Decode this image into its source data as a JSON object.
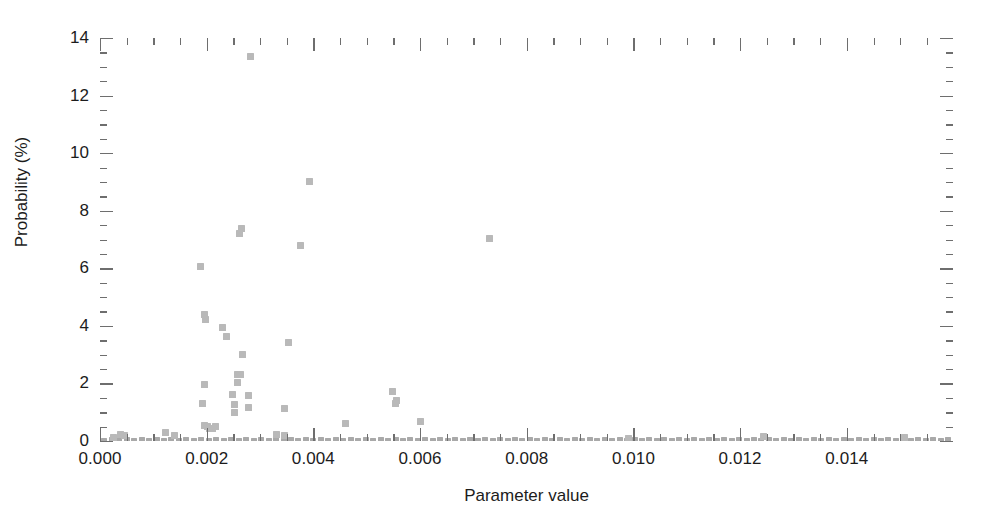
{
  "chart_data": {
    "type": "scatter",
    "title": "",
    "xlabel": "Parameter value",
    "ylabel": "Probability (%)",
    "xlim": [
      0.0,
      0.01599
    ],
    "ylim": [
      0,
      14
    ],
    "grid": false,
    "legend": null,
    "marker": {
      "shape": "square",
      "color": "#b9b9b9",
      "size_px": 7
    },
    "axis_color": "#6e6e6e",
    "x_ticks_major": [
      0.0,
      0.002,
      0.004,
      0.006,
      0.008,
      0.01,
      0.012,
      0.014
    ],
    "x_tick_labels": [
      "0.000",
      "0.002",
      "0.004",
      "0.006",
      "0.008",
      "0.010",
      "0.012",
      "0.014"
    ],
    "x_minor_interval": 0.0005,
    "y_ticks_major": [
      0,
      2,
      4,
      6,
      8,
      10,
      12,
      14
    ],
    "y_tick_labels": [
      "0",
      "2",
      "4",
      "6",
      "8",
      "10",
      "12",
      "14"
    ],
    "y_minor_interval": 0.5,
    "points": [
      [
        0.00283,
        13.35
      ],
      [
        0.00392,
        9.0
      ],
      [
        0.00731,
        7.05
      ],
      [
        0.00265,
        7.38
      ],
      [
        0.00262,
        7.22
      ],
      [
        0.00376,
        6.78
      ],
      [
        0.00188,
        6.05
      ],
      [
        0.00196,
        4.38
      ],
      [
        0.00197,
        4.22
      ],
      [
        0.00229,
        3.95
      ],
      [
        0.00237,
        3.62
      ],
      [
        0.00268,
        3.02
      ],
      [
        0.00353,
        3.42
      ],
      [
        0.00257,
        2.32
      ],
      [
        0.00263,
        2.3
      ],
      [
        0.00258,
        2.02
      ],
      [
        0.00196,
        1.95
      ],
      [
        0.00248,
        1.62
      ],
      [
        0.00279,
        1.58
      ],
      [
        0.00252,
        1.28
      ],
      [
        0.00193,
        1.3
      ],
      [
        0.00278,
        1.18
      ],
      [
        0.00252,
        0.98
      ],
      [
        0.00548,
        1.72
      ],
      [
        0.00556,
        1.42
      ],
      [
        0.00553,
        1.32
      ],
      [
        0.00345,
        1.12
      ],
      [
        0.00196,
        0.55
      ],
      [
        0.00202,
        0.5
      ],
      [
        0.00205,
        0.45
      ],
      [
        0.00211,
        0.42
      ],
      [
        0.00216,
        0.52
      ],
      [
        0.00461,
        0.62
      ],
      [
        0.00601,
        0.68
      ],
      [
        0.0033,
        0.22
      ],
      [
        0.00345,
        0.2
      ],
      [
        0.00123,
        0.28
      ],
      [
        0.00139,
        0.18
      ],
      [
        0.00038,
        0.22
      ],
      [
        0.00045,
        0.18
      ],
      [
        0.00026,
        0.12
      ],
      [
        0.00991,
        0.1
      ],
      [
        0.01243,
        0.14
      ],
      [
        0.01508,
        0.12
      ]
    ],
    "baseline_points": [
      [
        8e-05,
        0.03
      ],
      [
        0.00022,
        0.04
      ],
      [
        0.00036,
        0.03
      ],
      [
        0.0005,
        0.05
      ],
      [
        0.00064,
        0.03
      ],
      [
        0.00078,
        0.04
      ],
      [
        0.00092,
        0.03
      ],
      [
        0.00106,
        0.05
      ],
      [
        0.0012,
        0.03
      ],
      [
        0.00134,
        0.04
      ],
      [
        0.00148,
        0.03
      ],
      [
        0.00162,
        0.05
      ],
      [
        0.00176,
        0.03
      ],
      [
        0.0019,
        0.04
      ],
      [
        0.00204,
        0.03
      ],
      [
        0.00218,
        0.05
      ],
      [
        0.00232,
        0.03
      ],
      [
        0.00246,
        0.04
      ],
      [
        0.0026,
        0.03
      ],
      [
        0.00274,
        0.05
      ],
      [
        0.00288,
        0.03
      ],
      [
        0.00302,
        0.04
      ],
      [
        0.00316,
        0.03
      ],
      [
        0.0033,
        0.05
      ],
      [
        0.00344,
        0.03
      ],
      [
        0.00358,
        0.04
      ],
      [
        0.00372,
        0.03
      ],
      [
        0.00386,
        0.05
      ],
      [
        0.004,
        0.03
      ],
      [
        0.00414,
        0.04
      ],
      [
        0.00428,
        0.03
      ],
      [
        0.00442,
        0.05
      ],
      [
        0.00456,
        0.03
      ],
      [
        0.0047,
        0.04
      ],
      [
        0.00484,
        0.03
      ],
      [
        0.00498,
        0.05
      ],
      [
        0.00512,
        0.03
      ],
      [
        0.00526,
        0.04
      ],
      [
        0.0054,
        0.03
      ],
      [
        0.00554,
        0.05
      ],
      [
        0.00568,
        0.03
      ],
      [
        0.00582,
        0.04
      ],
      [
        0.00596,
        0.03
      ],
      [
        0.0061,
        0.05
      ],
      [
        0.00624,
        0.03
      ],
      [
        0.00638,
        0.04
      ],
      [
        0.00652,
        0.03
      ],
      [
        0.00666,
        0.05
      ],
      [
        0.0068,
        0.03
      ],
      [
        0.00694,
        0.04
      ],
      [
        0.00708,
        0.03
      ],
      [
        0.00722,
        0.05
      ],
      [
        0.00736,
        0.03
      ],
      [
        0.0075,
        0.04
      ],
      [
        0.00764,
        0.03
      ],
      [
        0.00778,
        0.05
      ],
      [
        0.00792,
        0.03
      ],
      [
        0.00806,
        0.04
      ],
      [
        0.0082,
        0.03
      ],
      [
        0.00834,
        0.05
      ],
      [
        0.00848,
        0.03
      ],
      [
        0.00862,
        0.04
      ],
      [
        0.00876,
        0.03
      ],
      [
        0.0089,
        0.05
      ],
      [
        0.00904,
        0.03
      ],
      [
        0.00918,
        0.04
      ],
      [
        0.00932,
        0.03
      ],
      [
        0.00946,
        0.05
      ],
      [
        0.0096,
        0.03
      ],
      [
        0.00974,
        0.04
      ],
      [
        0.00988,
        0.03
      ],
      [
        0.01002,
        0.05
      ],
      [
        0.01016,
        0.03
      ],
      [
        0.0103,
        0.04
      ],
      [
        0.01044,
        0.03
      ],
      [
        0.01058,
        0.05
      ],
      [
        0.01072,
        0.03
      ],
      [
        0.01086,
        0.04
      ],
      [
        0.011,
        0.03
      ],
      [
        0.01114,
        0.05
      ],
      [
        0.01128,
        0.03
      ],
      [
        0.01142,
        0.04
      ],
      [
        0.01156,
        0.03
      ],
      [
        0.0117,
        0.05
      ],
      [
        0.01184,
        0.03
      ],
      [
        0.01198,
        0.04
      ],
      [
        0.01212,
        0.03
      ],
      [
        0.01226,
        0.05
      ],
      [
        0.0124,
        0.03
      ],
      [
        0.01254,
        0.04
      ],
      [
        0.01268,
        0.03
      ],
      [
        0.01282,
        0.05
      ],
      [
        0.01296,
        0.03
      ],
      [
        0.0131,
        0.04
      ],
      [
        0.01324,
        0.03
      ],
      [
        0.01338,
        0.05
      ],
      [
        0.01352,
        0.03
      ],
      [
        0.01366,
        0.04
      ],
      [
        0.0138,
        0.03
      ],
      [
        0.01394,
        0.05
      ],
      [
        0.01408,
        0.03
      ],
      [
        0.01422,
        0.04
      ],
      [
        0.01436,
        0.03
      ],
      [
        0.0145,
        0.05
      ],
      [
        0.01464,
        0.03
      ],
      [
        0.01478,
        0.04
      ],
      [
        0.01492,
        0.03
      ],
      [
        0.01506,
        0.05
      ],
      [
        0.0152,
        0.03
      ],
      [
        0.01534,
        0.04
      ],
      [
        0.01548,
        0.03
      ],
      [
        0.01562,
        0.05
      ],
      [
        0.01576,
        0.03
      ],
      [
        0.0159,
        0.04
      ]
    ]
  }
}
